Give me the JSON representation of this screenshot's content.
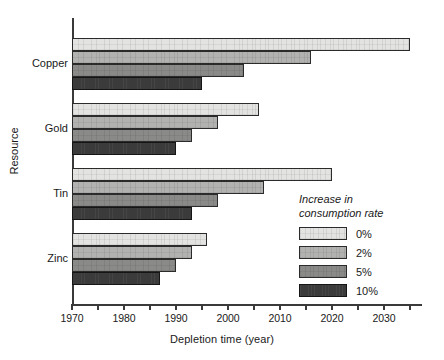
{
  "chart_data": {
    "type": "bar",
    "orientation": "horizontal",
    "title": "",
    "xlabel": "Depletion time (year)",
    "ylabel": "Resource",
    "categories": [
      "Copper",
      "Gold",
      "Tin",
      "Zinc"
    ],
    "xlim": [
      1970,
      2037
    ],
    "xticks": [
      1970,
      1975,
      1980,
      1985,
      1990,
      1995,
      2000,
      2005,
      2010,
      2015,
      2020,
      2025,
      2030,
      2035
    ],
    "xtick_labels": [
      "1970",
      "",
      "1980",
      "",
      "1990",
      "",
      "2000",
      "",
      "2010",
      "",
      "2020",
      "",
      "2030",
      ""
    ],
    "grid": false,
    "legend_position": "inside-lower-right",
    "legend_title": "Increase in\nconsumption rate",
    "series": [
      {
        "name": "0%",
        "color": "#e3e3e1",
        "values": [
          2035,
          2006,
          2020,
          1996
        ]
      },
      {
        "name": "2%",
        "color": "#b2b2b0",
        "values": [
          2016,
          1998,
          2007,
          1993
        ]
      },
      {
        "name": "5%",
        "color": "#8a8a88",
        "values": [
          2003,
          1993,
          1998,
          1990
        ]
      },
      {
        "name": "10%",
        "color": "#3b3b3b",
        "values": [
          1995,
          1990,
          1993,
          1987
        ]
      }
    ]
  },
  "axis": {
    "x_title": "Depletion time (year)",
    "y_title": "Resource",
    "x_tick_labels": [
      "1970",
      "1980",
      "1990",
      "2000",
      "2010",
      "2020",
      "2030"
    ]
  },
  "legend": {
    "title": "Increase in\nconsumption rate",
    "entries": [
      {
        "label": "0%"
      },
      {
        "label": "2%"
      },
      {
        "label": "5%"
      },
      {
        "label": "10%"
      }
    ]
  }
}
